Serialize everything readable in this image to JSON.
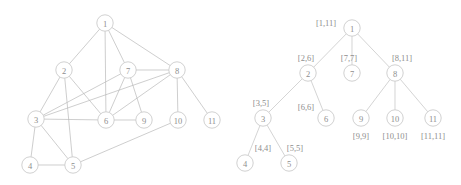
{
  "figure": {
    "panels": [
      {
        "name": "undirected-graph",
        "caption": ""
      },
      {
        "name": "interval-tree",
        "caption": ""
      }
    ]
  },
  "graph": {
    "node_radius": 8.2,
    "nodes": [
      {
        "id": "1",
        "label": "1",
        "x": 105,
        "y": 23
      },
      {
        "id": "2",
        "label": "2",
        "x": 64,
        "y": 70
      },
      {
        "id": "3",
        "label": "3",
        "x": 36,
        "y": 119
      },
      {
        "id": "4",
        "label": "4",
        "x": 30,
        "y": 165
      },
      {
        "id": "5",
        "label": "5",
        "x": 73,
        "y": 165
      },
      {
        "id": "6",
        "label": "6",
        "x": 106,
        "y": 120
      },
      {
        "id": "7",
        "label": "7",
        "x": 128,
        "y": 70
      },
      {
        "id": "8",
        "label": "8",
        "x": 177,
        "y": 70
      },
      {
        "id": "9",
        "label": "9",
        "x": 144,
        "y": 120
      },
      {
        "id": "10",
        "label": "10",
        "x": 178,
        "y": 120
      },
      {
        "id": "11",
        "label": "11",
        "x": 212,
        "y": 120
      }
    ],
    "edges": [
      [
        "1",
        "2"
      ],
      [
        "1",
        "6"
      ],
      [
        "1",
        "7"
      ],
      [
        "1",
        "8"
      ],
      [
        "2",
        "3"
      ],
      [
        "2",
        "5"
      ],
      [
        "2",
        "6"
      ],
      [
        "3",
        "4"
      ],
      [
        "3",
        "5"
      ],
      [
        "3",
        "6"
      ],
      [
        "3",
        "7"
      ],
      [
        "3",
        "8"
      ],
      [
        "4",
        "5"
      ],
      [
        "5",
        "10"
      ],
      [
        "6",
        "7"
      ],
      [
        "6",
        "8"
      ],
      [
        "6",
        "9"
      ],
      [
        "7",
        "8"
      ],
      [
        "7",
        "9"
      ],
      [
        "8",
        "10"
      ],
      [
        "8",
        "11"
      ]
    ]
  },
  "tree": {
    "node_radius": 8.2,
    "nodes": [
      {
        "id": "1",
        "label": "1",
        "x": 122,
        "y": 28,
        "interval": "[1,11]",
        "interval_x": 96,
        "interval_y": 23
      },
      {
        "id": "2",
        "label": "2",
        "x": 78,
        "y": 73,
        "interval": "[2,6]",
        "interval_x": 76,
        "interval_y": 58
      },
      {
        "id": "7",
        "label": "7",
        "x": 122,
        "y": 73,
        "interval": "[7,7]",
        "interval_x": 119,
        "interval_y": 58
      },
      {
        "id": "8",
        "label": "8",
        "x": 165,
        "y": 73,
        "interval": "[8,11]",
        "interval_x": 172,
        "interval_y": 58
      },
      {
        "id": "3",
        "label": "3",
        "x": 33,
        "y": 118,
        "interval": "[3,5]",
        "interval_x": 31,
        "interval_y": 103
      },
      {
        "id": "6",
        "label": "6",
        "x": 96,
        "y": 118,
        "interval": "[6,6]",
        "interval_x": 76,
        "interval_y": 107
      },
      {
        "id": "4",
        "label": "4",
        "x": 15,
        "y": 163,
        "interval": "[4,4]",
        "interval_x": 33,
        "interval_y": 148
      },
      {
        "id": "5",
        "label": "5",
        "x": 59,
        "y": 163,
        "interval": "[5,5]",
        "interval_x": 65,
        "interval_y": 148
      },
      {
        "id": "9",
        "label": "9",
        "x": 131,
        "y": 118,
        "interval": "[9,9]",
        "interval_x": 131,
        "interval_y": 136
      },
      {
        "id": "10",
        "label": "10",
        "x": 165,
        "y": 118,
        "interval": "[10,10]",
        "interval_x": 165,
        "interval_y": 136
      },
      {
        "id": "11",
        "label": "11",
        "x": 203,
        "y": 118,
        "interval": "[11,11]",
        "interval_x": 203,
        "interval_y": 136
      }
    ],
    "edges": [
      [
        "1",
        "2"
      ],
      [
        "1",
        "7"
      ],
      [
        "1",
        "8"
      ],
      [
        "2",
        "3"
      ],
      [
        "2",
        "6"
      ],
      [
        "3",
        "4"
      ],
      [
        "3",
        "5"
      ],
      [
        "8",
        "9"
      ],
      [
        "8",
        "10"
      ],
      [
        "8",
        "11"
      ]
    ]
  }
}
